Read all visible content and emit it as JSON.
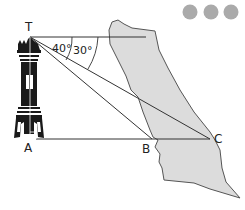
{
  "diagram": {
    "type": "angle-of-depression",
    "points": {
      "T": "T",
      "A": "A",
      "B": "B",
      "C": "C"
    },
    "angles": {
      "angle_1": "40°",
      "angle_2": "30°"
    },
    "decorations": {
      "dots_count": 3,
      "dot_color": "#aaaaaa"
    },
    "colors": {
      "land": "#dcdcdc",
      "line": "#333333",
      "tower": "#1a1a1a"
    }
  }
}
